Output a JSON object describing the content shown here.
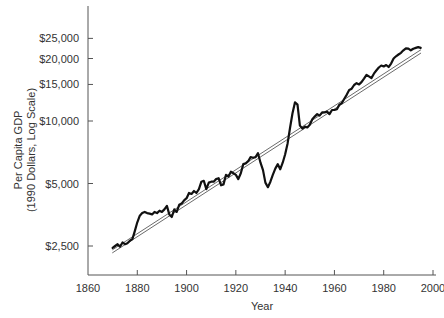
{
  "chart_data": {
    "type": "line",
    "title": "",
    "xlabel": "Year",
    "ylabel_lines": [
      "Per Capita GDP",
      "(1990 Dollars, Log Scale)"
    ],
    "ylabel": "Per Capita GDP (1990 Dollars, Log Scale)",
    "yscale": "log",
    "xlim": [
      1860,
      2000
    ],
    "ylim": [
      1800,
      33000
    ],
    "grid": false,
    "legend": null,
    "x_ticks": [
      1860,
      1880,
      1900,
      1920,
      1940,
      1960,
      1980,
      2000
    ],
    "x_tick_labels": [
      "1860",
      "1880",
      "1900",
      "1920",
      "1940",
      "1960",
      "1980",
      "2000"
    ],
    "y_ticks": [
      2500,
      5000,
      10000,
      15000,
      20000,
      25000
    ],
    "y_tick_labels": [
      "$2,500",
      "$5,000",
      "$10,000",
      "$15,000",
      "$20,000",
      "$25,000"
    ],
    "series": [
      {
        "name": "Per Capita GDP",
        "style": "thick",
        "color": "#111111",
        "x": [
          1870,
          1871,
          1872,
          1873,
          1874,
          1875,
          1876,
          1877,
          1878,
          1879,
          1880,
          1881,
          1882,
          1883,
          1884,
          1885,
          1886,
          1887,
          1888,
          1889,
          1890,
          1891,
          1892,
          1893,
          1894,
          1895,
          1896,
          1897,
          1898,
          1899,
          1900,
          1901,
          1902,
          1903,
          1904,
          1905,
          1906,
          1907,
          1908,
          1909,
          1910,
          1911,
          1912,
          1913,
          1914,
          1915,
          1916,
          1917,
          1918,
          1919,
          1920,
          1921,
          1922,
          1923,
          1924,
          1925,
          1926,
          1927,
          1928,
          1929,
          1930,
          1931,
          1932,
          1933,
          1934,
          1935,
          1936,
          1937,
          1938,
          1939,
          1940,
          1941,
          1942,
          1943,
          1944,
          1945,
          1946,
          1947,
          1948,
          1949,
          1950,
          1951,
          1952,
          1953,
          1954,
          1955,
          1956,
          1957,
          1958,
          1959,
          1960,
          1961,
          1962,
          1963,
          1964,
          1965,
          1966,
          1967,
          1968,
          1969,
          1970,
          1971,
          1972,
          1973,
          1974,
          1975,
          1976,
          1977,
          1978,
          1979,
          1980,
          1981,
          1982,
          1983,
          1984,
          1985,
          1986,
          1987,
          1988,
          1989,
          1990,
          1991,
          1992,
          1993,
          1994,
          1995
        ],
        "values": [
          2450,
          2500,
          2550,
          2480,
          2600,
          2550,
          2580,
          2650,
          2700,
          2950,
          3250,
          3500,
          3600,
          3650,
          3600,
          3580,
          3550,
          3650,
          3600,
          3700,
          3650,
          3750,
          3900,
          3550,
          3450,
          3750,
          3650,
          3950,
          4000,
          4150,
          4250,
          4500,
          4450,
          4600,
          4500,
          4700,
          5100,
          5150,
          4700,
          5050,
          5100,
          5100,
          5250,
          5300,
          4900,
          4950,
          5500,
          5400,
          5700,
          5600,
          5500,
          5250,
          5600,
          6200,
          6250,
          6400,
          6700,
          6650,
          6700,
          7000,
          6300,
          5800,
          5050,
          4800,
          5100,
          5500,
          5900,
          6200,
          5850,
          6300,
          6900,
          7800,
          9300,
          10900,
          12300,
          12000,
          9500,
          9200,
          9400,
          9300,
          9600,
          10200,
          10500,
          10800,
          10600,
          11000,
          11000,
          11100,
          10800,
          11300,
          11300,
          11400,
          12000,
          12200,
          12800,
          13400,
          14100,
          14300,
          14900,
          15200,
          15000,
          15400,
          16000,
          16700,
          16400,
          16100,
          16900,
          17500,
          18100,
          18500,
          18300,
          18600,
          18200,
          18900,
          20000,
          20500,
          20900,
          21300,
          21900,
          22400,
          22300,
          21900,
          22300,
          22500,
          22700,
          22500
        ]
      },
      {
        "name": "Trend line (upper)",
        "style": "thin",
        "color": "#444444",
        "x": [
          1870,
          1995
        ],
        "values": [
          2400,
          22000
        ]
      },
      {
        "name": "Trend line (lower)",
        "style": "thin",
        "color": "#444444",
        "x": [
          1870,
          1995
        ],
        "values": [
          2320,
          21200
        ]
      }
    ]
  },
  "layout": {
    "plot_left": 88,
    "plot_right": 444,
    "plot_top": 6,
    "plot_bottom": 275,
    "x_px_per_year": 2.4643,
    "y_ref_value": 10000,
    "y_ref_px": 121,
    "y_px_per_doubling": 62.5
  }
}
